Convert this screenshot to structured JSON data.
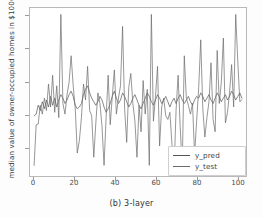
{
  "figure": {
    "caption": "(b) 3-layer",
    "ylabel": "median value of owner-occupied homes in $1000s",
    "xlabel": ""
  },
  "legend": {
    "position": "lower-right",
    "entries": [
      {
        "label": "y_pred",
        "color": "#555555"
      },
      {
        "label": "y_test",
        "color": "#6a6a6a"
      }
    ]
  },
  "axes": {
    "x_ticks": [
      "0",
      "20",
      "40",
      "60",
      "80",
      "100"
    ],
    "y_ticks": [
      "10",
      "20",
      "30",
      "40",
      "50"
    ]
  },
  "chart_data": {
    "type": "line",
    "title": "",
    "xlabel": "",
    "ylabel": "median value of owner-occupied homes in $1000s",
    "xlim": [
      -2,
      103
    ],
    "ylim": [
      4.5,
      52
    ],
    "grid": false,
    "legend_position": "lower right",
    "x": [
      0,
      1,
      2,
      3,
      4,
      5,
      6,
      7,
      8,
      9,
      10,
      11,
      12,
      13,
      14,
      15,
      16,
      17,
      18,
      19,
      20,
      21,
      22,
      23,
      24,
      25,
      26,
      27,
      28,
      29,
      30,
      31,
      32,
      33,
      34,
      35,
      36,
      37,
      38,
      39,
      40,
      41,
      42,
      43,
      44,
      45,
      46,
      47,
      48,
      49,
      50,
      51,
      52,
      53,
      54,
      55,
      56,
      57,
      58,
      59,
      60,
      61,
      62,
      63,
      64,
      65,
      66,
      67,
      68,
      69,
      70,
      71,
      72,
      73,
      74,
      75,
      76,
      77,
      78,
      79,
      80,
      81,
      82,
      83,
      84,
      85,
      86,
      87,
      88,
      89,
      90,
      91,
      92,
      93,
      94,
      95,
      96,
      97,
      98,
      99,
      100,
      101
    ],
    "series": [
      {
        "name": "y_pred",
        "color": "#555555",
        "values": [
          21.5,
          22.0,
          24.5,
          23.0,
          25.5,
          23.5,
          26.0,
          24.0,
          27.0,
          24.5,
          26.5,
          24.0,
          26.0,
          27.5,
          26.5,
          25.0,
          26.0,
          27.5,
          28.5,
          27.0,
          24.5,
          23.5,
          24.0,
          25.0,
          27.5,
          29.0,
          30.0,
          28.0,
          26.5,
          25.5,
          24.5,
          25.5,
          27.0,
          26.0,
          24.0,
          22.5,
          23.5,
          25.0,
          27.0,
          28.5,
          26.5,
          25.0,
          26.0,
          28.0,
          27.0,
          25.5,
          24.0,
          25.0,
          26.5,
          27.5,
          26.0,
          24.5,
          23.5,
          25.0,
          26.5,
          28.0,
          27.0,
          25.5,
          24.5,
          26.0,
          27.5,
          26.5,
          25.0,
          26.0,
          27.0,
          25.5,
          24.0,
          25.5,
          26.5,
          25.0,
          26.5,
          27.5,
          26.0,
          25.0,
          26.0,
          27.0,
          25.5,
          24.5,
          26.0,
          27.0,
          26.5,
          28.0,
          27.0,
          25.5,
          26.5,
          27.5,
          26.0,
          25.0,
          26.5,
          28.0,
          27.0,
          25.5,
          26.5,
          27.5,
          26.0,
          27.0,
          28.5,
          27.5,
          26.0,
          27.0,
          28.0,
          26.5
        ]
      },
      {
        "name": "y_test",
        "color": "#6a6a6a",
        "values": [
          7.5,
          19.0,
          19.2,
          24.5,
          22.0,
          26.5,
          23.0,
          30.5,
          24.0,
          33.0,
          22.5,
          30.0,
          21.0,
          50.2,
          25.0,
          22.0,
          27.5,
          31.0,
          38.5,
          30.0,
          23.5,
          11.0,
          14.5,
          21.0,
          30.5,
          26.0,
          35.5,
          23.0,
          21.5,
          9.8,
          19.5,
          28.0,
          25.0,
          18.5,
          7.5,
          21.0,
          33.0,
          19.0,
          27.0,
          34.5,
          22.0,
          26.5,
          30.0,
          46.8,
          23.5,
          14.0,
          29.5,
          33.5,
          25.0,
          20.0,
          9.8,
          24.5,
          17.0,
          31.5,
          22.0,
          29.0,
          7.5,
          50.2,
          20.0,
          27.0,
          35.5,
          13.0,
          24.0,
          26.5,
          21.5,
          20.5,
          22.5,
          13.5,
          5.8,
          23.0,
          33.0,
          18.5,
          7.0,
          38.5,
          26.5,
          24.5,
          22.0,
          25.0,
          10.5,
          20.0,
          29.5,
          43.0,
          23.5,
          15.5,
          21.0,
          25.5,
          36.5,
          20.5,
          17.0,
          40.0,
          25.0,
          31.0,
          43.5,
          19.5,
          22.5,
          28.0,
          36.0,
          24.0,
          50.2,
          37.0,
          25.5,
          26.0
        ]
      }
    ]
  }
}
